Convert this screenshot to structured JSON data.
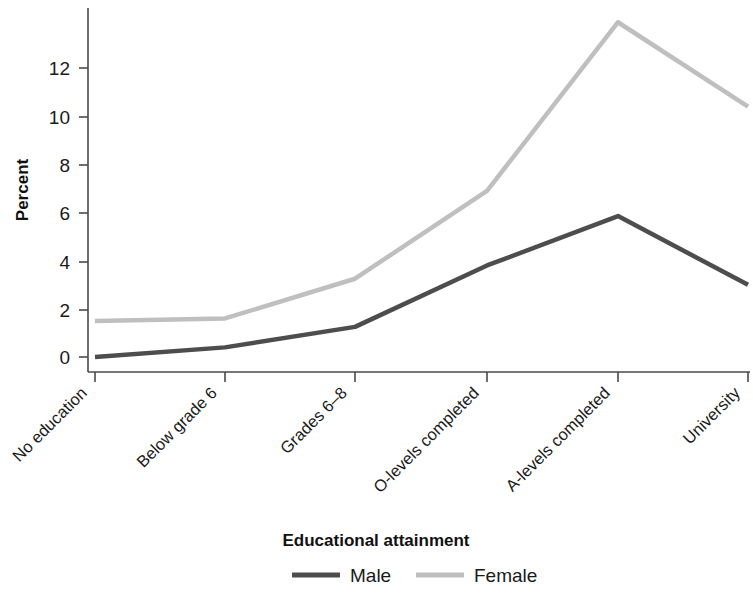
{
  "chart_data": {
    "type": "line",
    "title": "",
    "xlabel": "Educational attainment",
    "ylabel": "Percent",
    "categories": [
      "No education",
      "Below grade 6",
      "Grades 6–8",
      "O-levels completed",
      "A-levels completed",
      "University"
    ],
    "series": [
      {
        "name": "Male",
        "color": "#4d4d4d",
        "values": [
          0.0,
          0.4,
          1.25,
          3.8,
          5.85,
          3.0
        ]
      },
      {
        "name": "Female",
        "color": "#bfbfbf",
        "values": [
          1.5,
          1.6,
          3.25,
          6.9,
          13.9,
          10.4
        ]
      }
    ],
    "ylim": [
      0,
      14.6
    ],
    "yticks": [
      0,
      2,
      4,
      6,
      8,
      10,
      12
    ],
    "ytick_labels": [
      "0",
      "2",
      "4",
      "6",
      "8",
      "10",
      "12"
    ],
    "grid": false,
    "legend_position": "bottom"
  },
  "axes": {
    "y_title": "Percent",
    "x_title": "Educational attainment"
  },
  "legend": {
    "entries": [
      {
        "label": "Male",
        "color": "#4d4d4d"
      },
      {
        "label": "Female",
        "color": "#bfbfbf"
      }
    ]
  },
  "ticks": {
    "y": [
      "12",
      "10",
      "8",
      "6",
      "4",
      "2",
      "0"
    ],
    "x": [
      "No education",
      "Below grade 6",
      "Grades 6–8",
      "O-levels completed",
      "A-levels completed",
      "University"
    ]
  }
}
